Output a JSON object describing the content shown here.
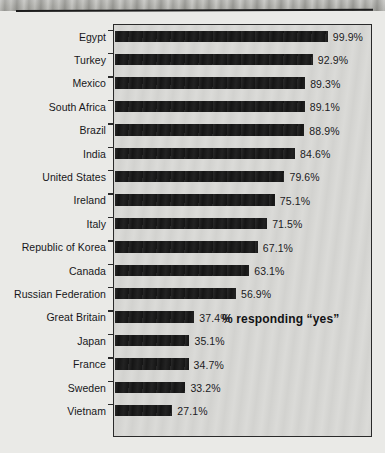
{
  "figure": {
    "annotation": "% responding “yes”",
    "plot_background": "#d9d9d6",
    "page_background": "#eaeae7",
    "bar_color": "#151515",
    "border_color": "#2a2a2a"
  },
  "chart_data": {
    "type": "bar",
    "orientation": "horizontal",
    "title": "",
    "subtitle": "",
    "xlabel": "",
    "ylabel": "",
    "annotation": "% responding “yes”",
    "grid": false,
    "legend": false,
    "xlim": [
      0,
      100
    ],
    "value_suffix": "%",
    "categories": [
      "Egypt",
      "Turkey",
      "Mexico",
      "South Africa",
      "Brazil",
      "India",
      "United States",
      "Ireland",
      "Italy",
      "Republic of Korea",
      "Canada",
      "Russian Federation",
      "Great Britain",
      "Japan",
      "France",
      "Sweden",
      "Vietnam"
    ],
    "values": [
      99.9,
      92.9,
      89.3,
      89.1,
      88.9,
      84.6,
      79.6,
      75.1,
      71.5,
      67.1,
      63.1,
      56.9,
      37.4,
      35.1,
      34.7,
      33.2,
      27.1
    ],
    "value_labels": [
      "99.9%",
      "92.9%",
      "89.3%",
      "89.1%",
      "88.9%",
      "84.6%",
      "79.6%",
      "75.1%",
      "71.5%",
      "67.1%",
      "63.1%",
      "56.9%",
      "37.4%",
      "35.1%",
      "34.7%",
      "33.2%",
      "27.1%"
    ]
  }
}
